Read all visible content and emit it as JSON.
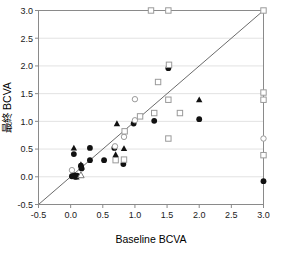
{
  "chart_data": {
    "type": "scatter",
    "title": "",
    "xlabel": "Baseline BCVA",
    "ylabel": "最終 BCVA",
    "xlim": [
      -0.5,
      3.0
    ],
    "ylim": [
      -0.5,
      3.0
    ],
    "xticks": [
      "-0.5",
      "0.0",
      "0.5",
      "1.0",
      "1.5",
      "2.0",
      "2.5",
      "3.0"
    ],
    "yticks": [
      "-0.5",
      "0.0",
      "0.5",
      "1.0",
      "1.5",
      "2.0",
      "2.5",
      "3.0"
    ],
    "xtick_values": [
      -0.5,
      0.0,
      0.5,
      1.0,
      1.5,
      2.0,
      2.5,
      3.0
    ],
    "ytick_values": [
      -0.5,
      0.0,
      0.5,
      1.0,
      1.5,
      2.0,
      2.5,
      3.0
    ],
    "grid": "horizontal",
    "legend": "none",
    "reference_line": {
      "name": "identity-line",
      "from": [
        -0.5,
        -0.5
      ],
      "to": [
        3.0,
        3.0
      ],
      "color": "#6b6b6b"
    },
    "series": [
      {
        "name": "filled-circle",
        "marker": "filled-circle",
        "color": "#111111",
        "points": [
          [
            0.02,
            0.01
          ],
          [
            0.05,
            0.03
          ],
          [
            0.08,
            0.0
          ],
          [
            0.1,
            0.02
          ],
          [
            0.05,
            0.41
          ],
          [
            0.16,
            0.2
          ],
          [
            0.17,
            0.15
          ],
          [
            0.3,
            0.52
          ],
          [
            0.3,
            0.3
          ],
          [
            0.52,
            0.3
          ],
          [
            0.68,
            0.52
          ],
          [
            0.82,
            0.23
          ],
          [
            0.98,
            0.96
          ],
          [
            1.3,
            1.01
          ],
          [
            1.52,
            1.96
          ],
          [
            2.0,
            1.04
          ],
          [
            3.0,
            -0.08
          ]
        ]
      },
      {
        "name": "filled-triangle",
        "marker": "filled-triangle",
        "color": "#111111",
        "points": [
          [
            0.05,
            0.52
          ],
          [
            0.04,
            0.02
          ],
          [
            0.09,
            0.0
          ],
          [
            0.16,
            0.22
          ],
          [
            0.17,
            0.18
          ],
          [
            0.7,
            0.4
          ],
          [
            0.83,
            0.51
          ],
          [
            0.72,
            0.96
          ],
          [
            2.0,
            1.39
          ]
        ]
      },
      {
        "name": "open-circle",
        "marker": "open-circle",
        "color": "#9a9a9a",
        "points": [
          [
            0.02,
            0.12
          ],
          [
            0.69,
            0.55
          ],
          [
            0.83,
            0.72
          ],
          [
            1.0,
            1.4
          ],
          [
            1.0,
            1.02
          ],
          [
            3.0,
            0.69
          ]
        ]
      },
      {
        "name": "open-square",
        "marker": "open-square",
        "color": "#9a9a9a",
        "points": [
          [
            0.7,
            0.3
          ],
          [
            0.83,
            0.31
          ],
          [
            0.84,
            0.82
          ],
          [
            1.08,
            1.09
          ],
          [
            1.25,
            3.0
          ],
          [
            1.36,
            1.71
          ],
          [
            1.3,
            1.15
          ],
          [
            1.52,
            3.0
          ],
          [
            1.53,
            2.02
          ],
          [
            1.52,
            1.39
          ],
          [
            1.52,
            0.69
          ],
          [
            1.7,
            1.15
          ],
          [
            3.0,
            3.0
          ],
          [
            3.0,
            1.52
          ],
          [
            3.0,
            1.39
          ],
          [
            3.0,
            0.39
          ]
        ]
      },
      {
        "name": "open-triangle",
        "marker": "open-triangle",
        "color": "#7a7a7a",
        "points": [
          [
            0.16,
            0.03
          ]
        ]
      }
    ]
  }
}
